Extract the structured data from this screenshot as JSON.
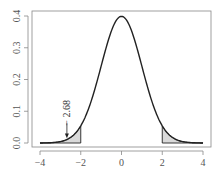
{
  "chart_data": {
    "type": "line",
    "title": "",
    "xlabel": "",
    "ylabel": "",
    "xlim": [
      -4,
      4
    ],
    "ylim": [
      0,
      0.4
    ],
    "grid": false,
    "legend": null,
    "series": [
      {
        "name": "standard normal density",
        "x": [
          -4,
          -3.5,
          -3,
          -2.5,
          -2,
          -1.5,
          -1,
          -0.5,
          0,
          0.5,
          1,
          1.5,
          2,
          2.5,
          3,
          3.5,
          4
        ],
        "values": [
          0.0001,
          0.0009,
          0.0044,
          0.0175,
          0.054,
          0.1295,
          0.242,
          0.3521,
          0.3989,
          0.3521,
          0.242,
          0.1295,
          0.054,
          0.0175,
          0.0044,
          0.0009,
          0.0001
        ]
      }
    ],
    "shaded_regions": [
      {
        "name": "left tail",
        "from": -4,
        "to": -2
      },
      {
        "name": "right tail",
        "from": 2,
        "to": 4
      }
    ],
    "annotations": [
      {
        "text": "− 2.68",
        "x": -2.68,
        "arrow": "down",
        "rotation": -90
      }
    ],
    "x_ticks": [
      -4,
      -2,
      0,
      2,
      4
    ],
    "x_tick_labels": [
      "−4",
      "−2",
      "0",
      "2",
      "4"
    ],
    "y_ticks": [
      0.0,
      0.1,
      0.2,
      0.3,
      0.4
    ],
    "y_tick_labels": [
      "0.0",
      "0.1",
      "0.2",
      "0.3",
      "0.4"
    ]
  },
  "colors": {
    "curve": "#222222",
    "shade": "#d9d9d9",
    "box": "#888888",
    "axis": "#888888"
  }
}
